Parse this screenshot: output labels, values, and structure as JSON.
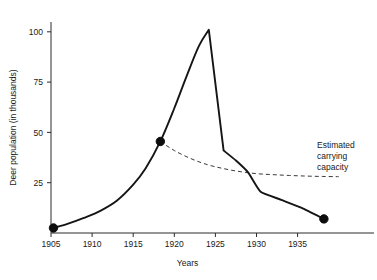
{
  "chart_data": {
    "type": "line",
    "title": "",
    "xlabel": "Years",
    "ylabel": "Deer population (in thousands)",
    "xlim": [
      1904,
      1940
    ],
    "ylim": [
      0,
      108
    ],
    "grid": false,
    "legend_position": "none",
    "xticks": [
      1905,
      1910,
      1915,
      1920,
      1925,
      1930,
      1935
    ],
    "xtick_labels": [
      "1905",
      "1910",
      "1915",
      "1920",
      "1925",
      "1930",
      "1935"
    ],
    "yticks": [
      25,
      50,
      75,
      100
    ],
    "ytick_labels": [
      "25",
      "50",
      "75",
      "100"
    ],
    "series": [
      {
        "name": "Deer population",
        "style": "solid",
        "x": [
          1905.3,
          1907.0,
          1909.0,
          1911.0,
          1913.0,
          1915.0,
          1916.5,
          1918.3,
          1920.0,
          1921.5,
          1923.0,
          1924.2,
          1926.0,
          1927.5,
          1929.0,
          1930.5,
          1933.0,
          1935.5,
          1938.2
        ],
        "values": [
          2.5,
          4.5,
          7.5,
          11.0,
          16.0,
          24.0,
          32.0,
          45.5,
          62.0,
          78.0,
          93.0,
          101.0,
          41.0,
          36.0,
          30.0,
          20.5,
          16.5,
          12.5,
          7.0
        ]
      },
      {
        "name": "Estimated carrying capacity",
        "style": "dashed",
        "x": [
          1918.3,
          1920.0,
          1922.0,
          1924.0,
          1926.0,
          1928.0,
          1930.0,
          1932.0,
          1934.0,
          1936.0,
          1938.0,
          1940.0
        ],
        "values": [
          45.5,
          41.0,
          37.0,
          34.0,
          32.0,
          30.5,
          29.5,
          29.0,
          28.6,
          28.3,
          28.1,
          28.0
        ]
      }
    ],
    "markers": [
      {
        "x": 1905.3,
        "y": 2.5
      },
      {
        "x": 1918.3,
        "y": 45.5
      },
      {
        "x": 1938.2,
        "y": 7.0
      }
    ],
    "annotations": [
      {
        "name": "carrying-capacity-label",
        "lines": [
          "Estimated",
          "carrying",
          "capacity"
        ],
        "x": 1936.5,
        "y": 42
      }
    ],
    "colors": {
      "population_line": "#151515",
      "capacity_line": "#3a3a3a",
      "axis": "#2b2b2b",
      "text": "#1a1a1a",
      "background": "#ffffff"
    }
  }
}
